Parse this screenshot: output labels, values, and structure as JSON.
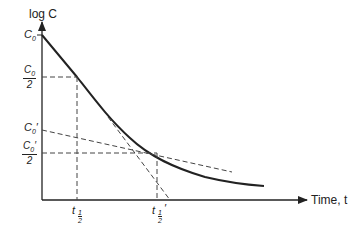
{
  "diagram": {
    "y_axis_label": "log C",
    "x_axis_label": "Time, t",
    "y_ticks": {
      "c0": {
        "base": "C",
        "sub": "0"
      },
      "c0_half": {
        "num_base": "C",
        "num_sub": "0",
        "den": "2"
      },
      "c0_prime": {
        "base": "C",
        "sub": "0",
        "prime": "′"
      },
      "c0_prime_half": {
        "num_base": "C",
        "num_sub": "0",
        "num_prime": "′",
        "den": "2"
      }
    },
    "x_ticks": {
      "t_half": {
        "base": "t",
        "sub_num": "1",
        "sub_den": "2"
      },
      "t_half_prime": {
        "base": "t",
        "sub_num": "1",
        "sub_den": "2",
        "prime": "′"
      }
    },
    "colors": {
      "line": "#222222",
      "dash": "#444444"
    }
  }
}
